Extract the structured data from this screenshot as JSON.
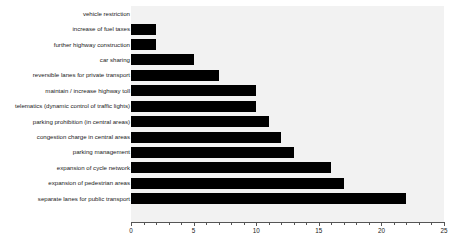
{
  "chart_data": {
    "type": "bar",
    "orientation": "horizontal",
    "title": "",
    "xlabel": "",
    "ylabel": "",
    "xlim": [
      0,
      25
    ],
    "grid": false,
    "legend": null,
    "bar_color": "#000000",
    "plot_background": "#f2f2f2",
    "xticks": [
      0,
      5,
      10,
      15,
      20,
      25
    ],
    "xtick_labels": [
      "0",
      "5",
      "10",
      "15",
      "20",
      "25"
    ],
    "minor_tick_interval": 1,
    "categories": [
      "vehicle restriction",
      "increase of fuel taxes",
      "further highway construction",
      "car sharing",
      "reversible lanes for private transport",
      "maintain / increase highway toll",
      "telematics (dynamic control of traffic lights)",
      "parking prohibition (in central areas)",
      "congestion charge in central areas",
      "parking management",
      "expansion of cycle network",
      "expansion of pedestrian areas",
      "separate lanes for public transport"
    ],
    "values": [
      0,
      2,
      2,
      5,
      7,
      10,
      10,
      11,
      12,
      13,
      16,
      17,
      22
    ]
  }
}
